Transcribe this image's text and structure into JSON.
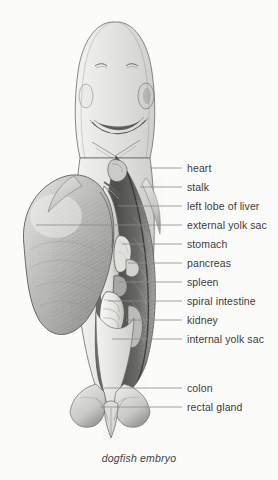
{
  "figure": {
    "title": "dogfish embryo",
    "caption": "dogfish embryo",
    "view": "ventral",
    "technique": "pen-and-ink stipple drawing",
    "colors": {
      "background": "#fbfbfa",
      "ink": "#3b3b3b",
      "leader_line": "#8a8a8a",
      "outline": "#5a5a5a",
      "shading_dark": "#4a4a4a",
      "shading_mid": "#9a9a9a",
      "shading_light": "#cfcfcf"
    }
  },
  "labels": [
    {
      "id": "heart",
      "text": "heart",
      "text_x": 187,
      "text_y": 171,
      "leader_x1": 150,
      "leader_y1": 168,
      "leader_x2": 182,
      "leader_y2": 168
    },
    {
      "id": "stalk",
      "text": "stalk",
      "text_x": 187,
      "text_y": 190,
      "leader_x1": 140,
      "leader_y1": 187,
      "leader_x2": 182,
      "leader_y2": 187
    },
    {
      "id": "left-lobe-liver",
      "text": "left lobe of liver",
      "text_x": 187,
      "text_y": 209,
      "leader_x1": 118,
      "leader_y1": 206,
      "leader_x2": 182,
      "leader_y2": 206
    },
    {
      "id": "external-yolk-sac",
      "text": "external yolk sac",
      "text_x": 187,
      "text_y": 228,
      "leader_x1": 36,
      "leader_y1": 225,
      "leader_x2": 182,
      "leader_y2": 225
    },
    {
      "id": "stomach",
      "text": "stomach",
      "text_x": 187,
      "text_y": 247,
      "leader_x1": 122,
      "leader_y1": 244,
      "leader_x2": 182,
      "leader_y2": 244
    },
    {
      "id": "pancreas",
      "text": "pancreas",
      "text_x": 187,
      "text_y": 266,
      "leader_x1": 128,
      "leader_y1": 263,
      "leader_x2": 182,
      "leader_y2": 263
    },
    {
      "id": "spleen",
      "text": "spleen",
      "text_x": 187,
      "text_y": 285,
      "leader_x1": 118,
      "leader_y1": 282,
      "leader_x2": 182,
      "leader_y2": 282
    },
    {
      "id": "spiral-intestine",
      "text": "spiral intestine",
      "text_x": 187,
      "text_y": 304,
      "leader_x1": 108,
      "leader_y1": 301,
      "leader_x2": 182,
      "leader_y2": 301
    },
    {
      "id": "kidney",
      "text": "kidney",
      "text_x": 187,
      "text_y": 323,
      "leader_x1": 126,
      "leader_y1": 320,
      "leader_x2": 182,
      "leader_y2": 320
    },
    {
      "id": "internal-yolk-sac",
      "text": "internal yolk sac",
      "text_x": 187,
      "text_y": 342,
      "leader_x1": 112,
      "leader_y1": 339,
      "leader_x2": 182,
      "leader_y2": 339
    },
    {
      "id": "colon",
      "text": "colon",
      "text_x": 187,
      "text_y": 391,
      "leader_x1": 104,
      "leader_y1": 388,
      "leader_x2": 182,
      "leader_y2": 388
    },
    {
      "id": "rectal-gland",
      "text": "rectal gland",
      "text_x": 187,
      "text_y": 410,
      "leader_x1": 100,
      "leader_y1": 407,
      "leader_x2": 182,
      "leader_y2": 407
    }
  ],
  "anatomy_regions": [
    {
      "id": "head",
      "name": "head with snout, nostrils and mouth"
    },
    {
      "id": "mouth",
      "name": "mouth"
    },
    {
      "id": "nostril-left",
      "name": "left nostril"
    },
    {
      "id": "nostril-right",
      "name": "right nostril"
    },
    {
      "id": "pectoral-fin-left",
      "name": "left pectoral fin"
    },
    {
      "id": "pectoral-fin-right",
      "name": "right pectoral fin"
    },
    {
      "id": "body-cavity",
      "name": "opened body cavity"
    },
    {
      "id": "external-yolk-sac",
      "name": "external yolk sac"
    },
    {
      "id": "pelvic-fin-left",
      "name": "left pelvic fin"
    },
    {
      "id": "pelvic-fin-right",
      "name": "right pelvic fin"
    },
    {
      "id": "cloaca",
      "name": "cloaca"
    }
  ]
}
